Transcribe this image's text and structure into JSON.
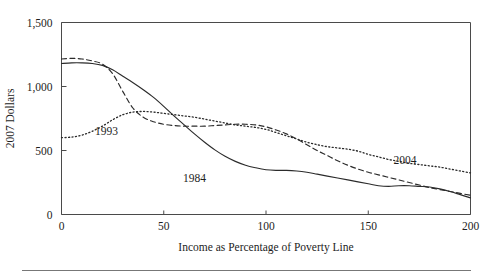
{
  "chart_data": {
    "type": "line",
    "title": "",
    "xlabel": "Income as Percentage of Poverty Line",
    "ylabel": "2007 Dollars",
    "xlim": [
      0,
      200
    ],
    "ylim": [
      0,
      1500
    ],
    "xticks": [
      0,
      50,
      100,
      150,
      200
    ],
    "xtick_labels": [
      "0",
      "50",
      "100",
      "150",
      "200"
    ],
    "yticks": [
      0,
      500,
      1000,
      1500
    ],
    "ytick_labels": [
      "0",
      "500",
      "1,000",
      "1,500"
    ],
    "grid": false,
    "legend_position": "inline-annotations",
    "series": [
      {
        "name": "1984",
        "style": "solid",
        "label_x": 65,
        "label_y": 255,
        "x": [
          0,
          5,
          10,
          15,
          20,
          25,
          30,
          35,
          40,
          45,
          50,
          55,
          60,
          65,
          70,
          75,
          80,
          85,
          90,
          95,
          100,
          105,
          110,
          115,
          120,
          125,
          130,
          135,
          140,
          145,
          150,
          155,
          160,
          165,
          170,
          175,
          180,
          185,
          190,
          195,
          200
        ],
        "y": [
          1180,
          1185,
          1185,
          1180,
          1165,
          1130,
          1080,
          1030,
          975,
          915,
          845,
          770,
          700,
          630,
          565,
          505,
          455,
          415,
          385,
          365,
          350,
          345,
          345,
          340,
          330,
          315,
          300,
          285,
          270,
          255,
          240,
          225,
          220,
          225,
          225,
          220,
          215,
          200,
          180,
          155,
          130
        ]
      },
      {
        "name": "1993",
        "style": "dashed",
        "label_x": 22,
        "label_y": 625,
        "x": [
          0,
          5,
          10,
          15,
          20,
          25,
          30,
          35,
          40,
          45,
          50,
          55,
          60,
          65,
          70,
          75,
          80,
          85,
          90,
          95,
          100,
          105,
          110,
          115,
          120,
          125,
          130,
          135,
          140,
          145,
          150,
          155,
          160,
          165,
          170,
          175,
          180,
          185,
          190,
          195,
          200
        ],
        "y": [
          1215,
          1220,
          1215,
          1200,
          1175,
          1100,
          960,
          830,
          760,
          725,
          705,
          695,
          690,
          690,
          690,
          695,
          700,
          705,
          705,
          700,
          685,
          660,
          630,
          590,
          545,
          500,
          460,
          420,
          385,
          355,
          330,
          310,
          290,
          270,
          250,
          230,
          210,
          195,
          180,
          165,
          150
        ]
      },
      {
        "name": "2004",
        "style": "dotted",
        "label_x": 168,
        "label_y": 395,
        "x": [
          0,
          5,
          10,
          15,
          20,
          25,
          30,
          35,
          40,
          45,
          50,
          55,
          60,
          65,
          70,
          75,
          80,
          85,
          90,
          95,
          100,
          105,
          110,
          115,
          120,
          125,
          130,
          135,
          140,
          145,
          150,
          155,
          160,
          165,
          170,
          175,
          180,
          185,
          190,
          195,
          200
        ],
        "y": [
          600,
          605,
          620,
          650,
          690,
          740,
          780,
          800,
          805,
          800,
          790,
          780,
          770,
          760,
          745,
          730,
          715,
          700,
          690,
          680,
          665,
          640,
          615,
          590,
          565,
          545,
          530,
          520,
          510,
          495,
          470,
          450,
          430,
          415,
          400,
          390,
          380,
          370,
          355,
          340,
          325
        ]
      }
    ]
  },
  "colors": {
    "axis": "#4a4a4a",
    "curve": "#2b2b2b",
    "text": "#1d1d1d",
    "rule": "#777777",
    "background": "#ffffff"
  }
}
